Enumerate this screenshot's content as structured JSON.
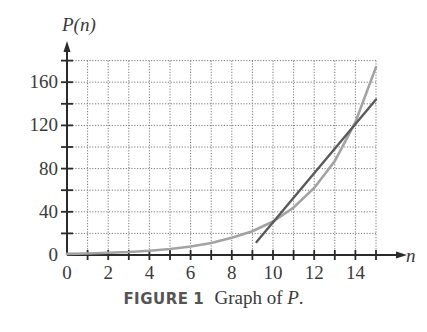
{
  "figure": {
    "label": "FIGURE",
    "number": "1",
    "caption_prefix": "Graph of ",
    "caption_var": "P",
    "caption_suffix": "."
  },
  "colors": {
    "curve": "#a3a3a3",
    "tangent": "#5a5a5a",
    "axis": "#2a2a2a",
    "grid": "#777777"
  },
  "chart_data": {
    "type": "line",
    "title": "Graph of P",
    "xlabel": "n",
    "ylabel": "P(n)",
    "xlim": [
      0,
      15
    ],
    "ylim": [
      0,
      180
    ],
    "x_ticks": [
      0,
      2,
      4,
      6,
      8,
      10,
      12,
      14
    ],
    "y_ticks": [
      0,
      40,
      80,
      120,
      160
    ],
    "x_minor_step": 1,
    "y_minor_step": 20,
    "grid": true,
    "legend": null,
    "series": [
      {
        "name": "P(n)",
        "style": "curve, light gray",
        "x": [
          0,
          1,
          2,
          3,
          4,
          5,
          6,
          7,
          8,
          9,
          10,
          11,
          12,
          13,
          14,
          15
        ],
        "y": [
          1,
          1.4,
          2,
          2.8,
          4,
          5.6,
          7.9,
          11,
          16,
          22,
          31,
          44,
          62,
          87,
          123,
          174
        ]
      },
      {
        "name": "tangent line at n=12",
        "style": "straight line, dark gray",
        "x": [
          9.2,
          15
        ],
        "y": [
          12,
          144
        ]
      }
    ],
    "annotations": []
  }
}
